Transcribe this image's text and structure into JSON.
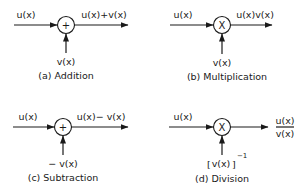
{
  "diagrams": {
    "addition": {
      "input_label": "u(x)",
      "operator_symbol": "+",
      "output_label": "u(x)+v(x)",
      "side_input_label": "v(x)",
      "caption": "(a) Addition"
    },
    "multiplication": {
      "input_label": "u(x)",
      "operator_symbol": "X",
      "output_label": "u(x)v(x)",
      "side_input_label": "v(x)",
      "caption": "(b) Multiplication"
    },
    "subtraction": {
      "input_label": "u(x)",
      "operator_symbol": "+",
      "output_label": "u(x)− v(x)",
      "side_input_label": "− v(x)",
      "caption": "(c) Subtraction"
    },
    "division": {
      "input_label": "u(x)",
      "operator_symbol": "X",
      "output_numerator": "u(x)",
      "output_denominator": "v(x)",
      "side_input_label": "v(x)",
      "side_input_bracket_left": "[",
      "side_input_bracket_right": "]",
      "side_input_exponent": "−1",
      "caption": "(d) Division"
    }
  }
}
